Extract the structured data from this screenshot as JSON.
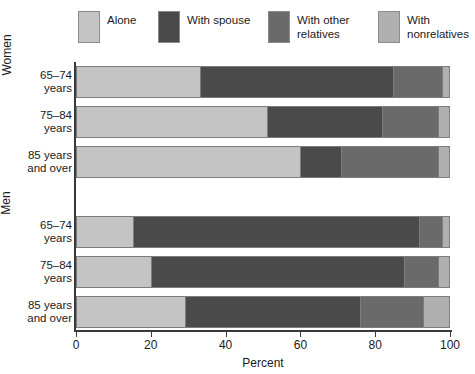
{
  "chart_data": {
    "type": "bar",
    "orientation": "horizontal",
    "stacked": true,
    "percent_stacked": true,
    "title": "",
    "xlabel": "Percent",
    "ylabel": "",
    "xlim": [
      0,
      100
    ],
    "xticks": [
      0,
      20,
      40,
      60,
      80,
      100
    ],
    "xtick_labels": [
      "0",
      "20",
      "40",
      "60",
      "80",
      "100"
    ],
    "grid": false,
    "legend_position": "top",
    "groups": [
      "Women",
      "Men"
    ],
    "categories": [
      "65–74\nyears",
      "75–84\nyears",
      "85 years\nand over",
      "65–74\nyears",
      "75–84\nyears",
      "85 years\nand over"
    ],
    "series": [
      {
        "name": "Alone",
        "color": "#c4c4c4",
        "values": [
          33,
          51,
          60,
          15,
          20,
          29
        ]
      },
      {
        "name": "With spouse",
        "color": "#4a4a4a",
        "values": [
          52,
          31,
          11,
          77,
          68,
          47
        ]
      },
      {
        "name": "With other\nrelatives",
        "color": "#6a6a6a",
        "values": [
          13,
          15,
          26,
          6,
          9,
          17
        ]
      },
      {
        "name": "With\nnonrelatives",
        "color": "#b0b0b0",
        "values": [
          2,
          3,
          3,
          2,
          3,
          7
        ]
      }
    ]
  },
  "legend": {
    "items": [
      {
        "label": "Alone",
        "color": "#c4c4c4"
      },
      {
        "label": "With spouse",
        "color": "#4a4a4a"
      },
      {
        "label": "With other\nrelatives",
        "color": "#6a6a6a"
      },
      {
        "label": "With\nnonrelatives",
        "color": "#b0b0b0"
      }
    ]
  },
  "axis": {
    "x_title": "Percent",
    "tick_labels": [
      "0",
      "20",
      "40",
      "60",
      "80",
      "100"
    ]
  },
  "group_labels": {
    "women": "Women",
    "men": "Men"
  },
  "category_labels": [
    "65–74\nyears",
    "75–84\nyears",
    "85 years\nand over",
    "65–74\nyears",
    "75–84\nyears",
    "85 years\nand over"
  ]
}
